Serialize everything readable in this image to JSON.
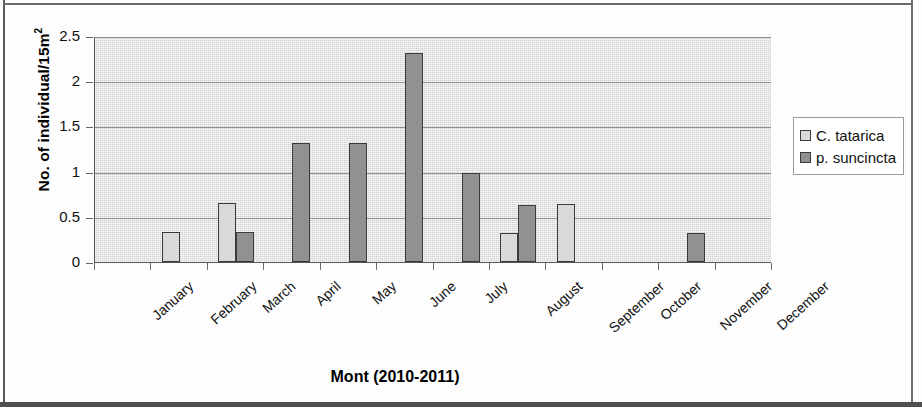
{
  "chart_data": {
    "type": "bar",
    "title": "",
    "xlabel": "Mont (2010-2011)",
    "ylabel": "No. of individual/15m",
    "ylabel_sup": "2",
    "categories": [
      "January",
      "February",
      "March",
      "April",
      "May",
      "June",
      "July",
      "August",
      "September",
      "October",
      "November",
      "December"
    ],
    "series": [
      {
        "name": "C. tatarica",
        "color": "#d9d9d9",
        "values": [
          0,
          0.33,
          0.65,
          0,
          0,
          0,
          0,
          0.32,
          0.64,
          0,
          0,
          0
        ]
      },
      {
        "name": "p. suncincta",
        "color": "#919191",
        "values": [
          0,
          0,
          0.33,
          1.32,
          1.32,
          2.31,
          0.99,
          0.63,
          0,
          0,
          0.32,
          0
        ]
      }
    ],
    "ylim": [
      0,
      2.5
    ],
    "ytick_values": [
      0,
      0.5,
      1,
      1.5,
      2,
      2.5
    ],
    "ytick_labels": [
      "0",
      "0.5",
      "1",
      "1.5",
      "2",
      "2.5"
    ],
    "grid": true,
    "legend_position": "right",
    "plot_background": "#e8e8e8",
    "bar_border_color": "#3a3a3a"
  }
}
